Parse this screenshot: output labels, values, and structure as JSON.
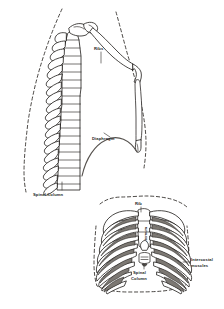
{
  "figure": {
    "background_color": "#ffffff",
    "ink_color": "#1d1a18",
    "muscle_shade_color": "#7c7873",
    "diaphragm_color": "#56524e",
    "views": [
      {
        "id": "lateral-view",
        "name": "lateral-thorax-view",
        "description": "Side view of the upper body showing curved spinal column, ribs, sternum and the dome of the diaphragm inside a dashed body outline."
      },
      {
        "id": "anterior-view",
        "name": "anterior-ribcage-view",
        "description": "Front view of the rib cage showing sternum, rib pairs, shaded intercostal muscles and the spinal column behind."
      }
    ]
  },
  "labels": {
    "lateral": {
      "ribs": "Ribs",
      "diaphragm": "Diaphragm",
      "spinal_column": "Spinal Column"
    },
    "anterior": {
      "rib": "Rib",
      "sternum": "Sternum",
      "spinal_column_line1": "Spinal",
      "spinal_column_line2": "Column",
      "intercostal_line1": "Intercostal",
      "intercostal_line2": "muscles"
    }
  },
  "counts": {
    "lateral_vertebrae": 17,
    "anterior_rib_pairs": 10
  }
}
